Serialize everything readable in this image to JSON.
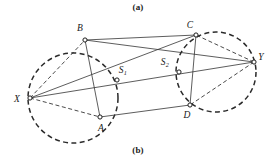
{
  "figure": {
    "caption_top": "(a)",
    "caption_bottom": "(b)",
    "background_color": "#ffffff",
    "stroke_color": "#333333",
    "dashed_color": "#2b2b2b",
    "label_color": "#181818"
  },
  "points": {
    "X": {
      "label": "X",
      "sub": "",
      "x": 30,
      "y": 98,
      "label_x": 17,
      "label_y": 102
    },
    "Y": {
      "label": "Y",
      "sub": "",
      "x": 254,
      "y": 62,
      "label_x": 261,
      "label_y": 60
    },
    "A": {
      "label": "A",
      "sub": "",
      "x": 100,
      "y": 117,
      "label_x": 101,
      "label_y": 131
    },
    "B": {
      "label": "B",
      "sub": "",
      "x": 85,
      "y": 40,
      "label_x": 80,
      "label_y": 31
    },
    "C": {
      "label": "C",
      "sub": "",
      "x": 196,
      "y": 35,
      "label_x": 190,
      "label_y": 28
    },
    "D": {
      "label": "D",
      "sub": "",
      "x": 190,
      "y": 105,
      "label_x": 187,
      "label_y": 118
    },
    "S1": {
      "label": "S",
      "sub": "1",
      "x": 117,
      "y": 80,
      "label_x": 121,
      "label_y": 73
    },
    "S2": {
      "label": "S",
      "sub": "2",
      "x": 179,
      "y": 72,
      "label_x": 163,
      "label_y": 65
    }
  },
  "circles": [
    {
      "name": "left-circle",
      "cx": 73,
      "cy": 98,
      "r": 45
    },
    {
      "name": "right-circle",
      "cx": 216,
      "cy": 72,
      "r": 40
    }
  ],
  "solid_edges": [
    {
      "name": "edge-B-C",
      "from": "B",
      "to": "C"
    },
    {
      "name": "edge-A-D",
      "from": "A",
      "to": "D"
    },
    {
      "name": "edge-X-Y",
      "from": "X",
      "to": "Y"
    },
    {
      "name": "edge-X-C",
      "from": "X",
      "to": "C"
    },
    {
      "name": "edge-B-Y",
      "from": "B",
      "to": "Y"
    },
    {
      "name": "edge-B-A",
      "from": "B",
      "to": "A"
    },
    {
      "name": "edge-C-D",
      "from": "C",
      "to": "D"
    }
  ],
  "dashed_edges": [
    {
      "name": "chord-X-B",
      "from": "X",
      "to": "B"
    },
    {
      "name": "chord-X-A",
      "from": "X",
      "to": "A"
    },
    {
      "name": "chord-Y-C",
      "from": "Y",
      "to": "C"
    },
    {
      "name": "chord-Y-D",
      "from": "Y",
      "to": "D"
    }
  ]
}
